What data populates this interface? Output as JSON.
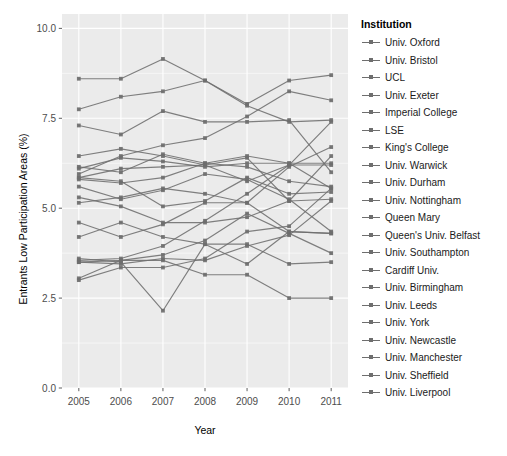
{
  "chart_data": {
    "type": "line",
    "title": "",
    "xlabel": "Year",
    "ylabel": "Entrants Low Participation Areas (%)",
    "legend_title": "Institution",
    "legend_position": "right",
    "grid": true,
    "panel_background": "#ebebeb",
    "grid_color": "#ffffff",
    "line_color": "#6e6e6e",
    "x": [
      2005,
      2006,
      2007,
      2008,
      2009,
      2010,
      2011
    ],
    "xtick_labels": [
      "2005",
      "2006",
      "2007",
      "2008",
      "2009",
      "2010",
      "2011"
    ],
    "ytick_values": [
      0.0,
      2.5,
      5.0,
      7.5,
      10.0
    ],
    "ytick_labels": [
      "0.0",
      "2.5",
      "5.0",
      "7.5",
      "10.0"
    ],
    "xlim": [
      2004.6,
      2011.4
    ],
    "ylim": [
      0.0,
      10.4
    ],
    "series": [
      {
        "name": "Univ. Oxford",
        "values": [
          3.05,
          3.55,
          3.55,
          3.15,
          3.15,
          2.5,
          2.5
        ]
      },
      {
        "name": "Univ. Bristol",
        "values": [
          3.5,
          3.55,
          3.7,
          4.1,
          4.85,
          4.3,
          3.75
        ]
      },
      {
        "name": "UCL",
        "values": [
          5.3,
          5.05,
          4.6,
          4.6,
          4.75,
          5.2,
          5.25
        ]
      },
      {
        "name": "Univ. Exeter",
        "values": [
          3.6,
          3.5,
          2.15,
          4.0,
          4.0,
          3.45,
          3.5
        ]
      },
      {
        "name": "Imperial College",
        "values": [
          4.2,
          4.6,
          4.2,
          4.0,
          3.45,
          4.35,
          4.3
        ]
      },
      {
        "name": "LSE",
        "values": [
          3.55,
          3.6,
          3.95,
          4.65,
          5.4,
          6.2,
          7.4
        ]
      },
      {
        "name": "King's College",
        "values": [
          5.95,
          6.45,
          6.75,
          6.95,
          7.55,
          8.25,
          8.0
        ]
      },
      {
        "name": "Univ. Warwick",
        "values": [
          3.5,
          3.45,
          3.6,
          3.55,
          3.95,
          4.25,
          5.2
        ]
      },
      {
        "name": "Univ. Durham",
        "values": [
          3.0,
          3.35,
          3.35,
          3.6,
          4.35,
          4.5,
          5.55
        ]
      },
      {
        "name": "Univ. Nottingham",
        "values": [
          5.15,
          5.3,
          5.55,
          5.4,
          5.15,
          4.35,
          4.3
        ]
      },
      {
        "name": "Queen Mary",
        "values": [
          6.45,
          6.65,
          6.45,
          6.2,
          5.75,
          6.2,
          6.2
        ]
      },
      {
        "name": "Queen's Univ. Belfast",
        "values": [
          8.6,
          8.6,
          9.15,
          8.55,
          7.9,
          8.55,
          8.7
        ]
      },
      {
        "name": "Univ. Southampton",
        "values": [
          5.8,
          5.7,
          5.85,
          6.25,
          6.45,
          6.25,
          5.55
        ]
      },
      {
        "name": "Cardiff Univ.",
        "values": [
          4.6,
          4.2,
          4.55,
          5.15,
          5.15,
          6.15,
          6.7
        ]
      },
      {
        "name": "Univ. Birmingham",
        "values": [
          5.85,
          5.75,
          5.05,
          5.2,
          5.85,
          5.4,
          5.45
        ]
      },
      {
        "name": "Univ. Leeds",
        "values": [
          7.75,
          8.1,
          8.25,
          8.55,
          7.85,
          7.4,
          7.45
        ]
      },
      {
        "name": "Univ. York",
        "values": [
          5.6,
          5.25,
          5.5,
          5.95,
          5.8,
          5.25,
          4.35
        ]
      },
      {
        "name": "Univ. Newcastle",
        "values": [
          7.3,
          7.05,
          7.7,
          7.4,
          7.4,
          7.45,
          6.0
        ]
      },
      {
        "name": "Univ. Manchester",
        "values": [
          6.15,
          6.0,
          6.5,
          6.25,
          6.15,
          5.75,
          5.6
        ]
      },
      {
        "name": "Univ. Sheffield",
        "values": [
          6.1,
          6.4,
          6.3,
          6.15,
          6.25,
          6.25,
          6.25
        ]
      },
      {
        "name": "Univ. Liverpool",
        "values": [
          5.85,
          6.1,
          6.15,
          6.2,
          6.4,
          5.2,
          6.45
        ]
      }
    ]
  },
  "panel": {
    "left": 62,
    "top": 14,
    "right": 348,
    "bottom": 388
  }
}
